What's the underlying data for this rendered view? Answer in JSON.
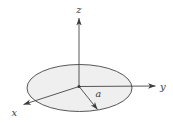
{
  "figure": {
    "type": "diagram",
    "labels": {
      "z_axis": "z",
      "y_axis": "y",
      "x_axis": "x",
      "radius": "a"
    },
    "colors": {
      "background": "#ffffff",
      "line": "#3a3a3a",
      "disk_fill": "#efefef"
    }
  }
}
